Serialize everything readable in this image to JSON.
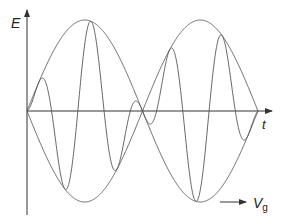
{
  "figure": {
    "type": "wave-packet-diagram",
    "y_axis_label": "E",
    "x_axis_label": "t",
    "group_velocity_label": "V",
    "group_velocity_subscript": "g",
    "colors": {
      "line": "#555555",
      "axis": "#333333",
      "text": "#222222"
    }
  },
  "chart_data": {
    "type": "line",
    "title": "",
    "xlabel": "t",
    "ylabel": "E",
    "annotations": [
      "V_g (arrow indicating group velocity direction)"
    ],
    "series": [
      {
        "name": "envelope (upper)",
        "description": "|sin| envelope, 2 lobes"
      },
      {
        "name": "envelope (lower)",
        "description": "mirror of upper envelope"
      },
      {
        "name": "carrier wave",
        "description": "high-frequency oscillation modulated by envelope"
      }
    ],
    "grid": false,
    "legend": "none"
  }
}
